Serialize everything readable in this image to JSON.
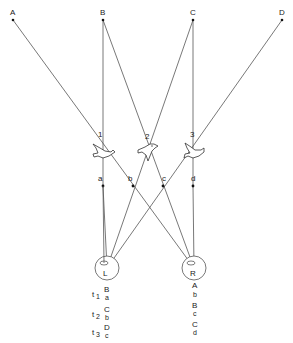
{
  "diagram": {
    "sources": [
      {
        "id": "A",
        "label": "A",
        "x": 13,
        "y": 20
      },
      {
        "id": "B",
        "label": "B",
        "x": 103,
        "y": 20
      },
      {
        "id": "C",
        "label": "C",
        "x": 193,
        "y": 20
      },
      {
        "id": "D",
        "label": "D",
        "x": 282,
        "y": 20
      }
    ],
    "birds": [
      {
        "id": "1",
        "label": "1",
        "x": 103,
        "y": 155
      },
      {
        "id": "2",
        "label": "2",
        "x": 148,
        "y": 155
      },
      {
        "id": "3",
        "label": "3",
        "x": 193,
        "y": 155
      }
    ],
    "midpoints": [
      {
        "id": "a",
        "label": "a",
        "x": 103,
        "y": 186
      },
      {
        "id": "b",
        "label": "b",
        "x": 133,
        "y": 186
      },
      {
        "id": "c",
        "label": "c",
        "x": 163,
        "y": 186
      },
      {
        "id": "d",
        "label": "d",
        "x": 193,
        "y": 186
      }
    ],
    "eyes": [
      {
        "id": "L",
        "label": "L",
        "x": 107,
        "y": 268
      },
      {
        "id": "R",
        "label": "R",
        "x": 194,
        "y": 268
      }
    ],
    "left_sequence": [
      {
        "time": "t",
        "sub": "1",
        "top": "B",
        "bottom": "a"
      },
      {
        "time": "t",
        "sub": "2",
        "top": "C",
        "bottom": "b"
      },
      {
        "time": "t",
        "sub": "3",
        "top": "D",
        "bottom": "c"
      }
    ],
    "right_sequence": [
      {
        "top": "A",
        "bottom": "b"
      },
      {
        "top": "B",
        "bottom": "c"
      },
      {
        "top": "C",
        "bottom": "d"
      }
    ]
  }
}
